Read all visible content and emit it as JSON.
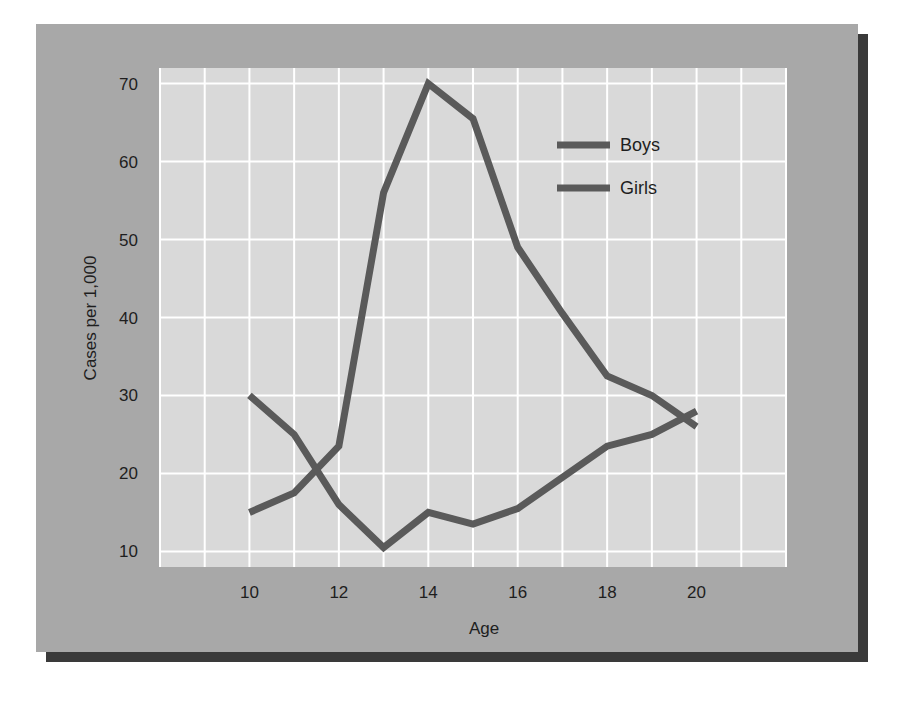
{
  "chart_data": {
    "type": "line",
    "title": "",
    "xlabel": "Age",
    "ylabel": "Cases per 1,000",
    "x": [
      10,
      11,
      12,
      13,
      14,
      15,
      16,
      17,
      18,
      19,
      20
    ],
    "xticks": [
      10,
      12,
      14,
      16,
      18,
      20
    ],
    "yticks": [
      10,
      20,
      30,
      40,
      50,
      60,
      70
    ],
    "xlim": [
      8,
      22
    ],
    "ylim": [
      8,
      72
    ],
    "grid": true,
    "legend_position": "upper right",
    "legend_labels": [
      "Boys",
      "Girls"
    ],
    "series_legend_mapping": "unverified — both legend swatches render as the same grey in this image, so which line is Boys and which is Girls cannot be determined from the pixels; labels below follow legend order only",
    "series": [
      {
        "name": "Boys",
        "label_assignment": "unverified",
        "description": "line peaking at age 14",
        "values": [
          15,
          17.5,
          23.5,
          56,
          70,
          65.5,
          49,
          40.5,
          32.5,
          30,
          26
        ]
      },
      {
        "name": "Girls",
        "label_assignment": "unverified",
        "description": "line dipping at age 13",
        "values": [
          30,
          25,
          16,
          10.5,
          15,
          13.5,
          15.5,
          19.5,
          23.5,
          25,
          28
        ]
      }
    ]
  },
  "colors": {
    "card_background": "#a8a8a8",
    "card_shadow": "#3a3a3a",
    "plot_background": "#d9d9d9",
    "grid": "#ffffff",
    "series_line": "#5a5a5a",
    "text": "#1e1e1e"
  }
}
